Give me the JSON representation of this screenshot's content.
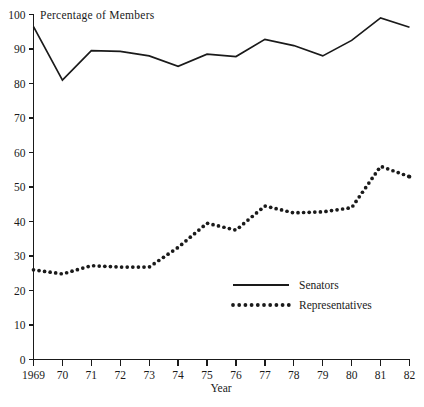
{
  "chart_data": {
    "type": "line",
    "title": "Percentage of Members",
    "xlabel": "Year",
    "ylabel": "",
    "x": [
      1969,
      1970,
      1971,
      1972,
      1973,
      1974,
      1975,
      1976,
      1977,
      1978,
      1979,
      1980,
      1981,
      1982
    ],
    "categories": [
      "1969",
      "70",
      "71",
      "72",
      "73",
      "74",
      "75",
      "76",
      "77",
      "78",
      "79",
      "80",
      "81",
      "82"
    ],
    "xlim": [
      1969,
      1982
    ],
    "ylim": [
      0,
      100
    ],
    "y_ticks": [
      0,
      10,
      20,
      30,
      40,
      50,
      60,
      70,
      80,
      90,
      100
    ],
    "y_tick_labels": [
      "0",
      "10",
      "20",
      "30",
      "40",
      "50",
      "60",
      "70",
      "80",
      "90",
      "100"
    ],
    "grid": false,
    "legend_position": "center-right-lower",
    "series": [
      {
        "name": "Senators",
        "style": "solid",
        "color": "#1a1a1a",
        "values": [
          96.5,
          81.0,
          89.5,
          89.3,
          88.0,
          85.0,
          88.5,
          87.8,
          92.8,
          91.0,
          88.0,
          92.5,
          99.0,
          96.3
        ]
      },
      {
        "name": "Representatives",
        "style": "dotted",
        "color": "#1a1a1a",
        "values": [
          26.0,
          24.8,
          27.2,
          26.8,
          26.8,
          32.5,
          39.5,
          37.5,
          44.5,
          42.5,
          42.8,
          44.0,
          56.0,
          53.0
        ]
      }
    ]
  },
  "legend": {
    "entries": [
      {
        "label": "Senators",
        "style": "solid"
      },
      {
        "label": "Representatives",
        "style": "dotted"
      }
    ]
  }
}
